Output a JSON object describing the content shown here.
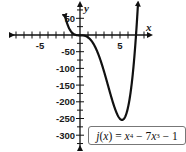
{
  "chart_data": {
    "type": "line",
    "title": "",
    "function_label": "j(x) = x^4 - 7x^3 - 1",
    "function_label_parts": {
      "name": "j",
      "var": "x",
      "equals": "=",
      "term1_base": "x",
      "term1_exp": "4",
      "minus1": "−",
      "term2_coef": "7",
      "term2_base": "x",
      "term2_exp": "3",
      "minus2": "−",
      "constant": "1"
    },
    "xlabel": "x",
    "ylabel": "y",
    "xlim": [
      -9.5,
      9.5
    ],
    "ylim": [
      -340,
      90
    ],
    "x_tick_step": 1,
    "y_tick_step": 25,
    "x_tick_labels": [
      "-5",
      "5"
    ],
    "x_tick_label_values": [
      -5,
      5
    ],
    "y_tick_labels": [
      "50",
      "-50",
      "-100",
      "-150",
      "-200",
      "-250",
      "-300"
    ],
    "y_tick_label_values": [
      50,
      -50,
      -100,
      -150,
      -200,
      -250,
      -300
    ],
    "grid": false,
    "legend": "none",
    "series": [
      {
        "name": "j(x) = x^4 - 7x^3 - 1",
        "x": [
          -2.0,
          -1.5,
          -1.0,
          -0.5,
          0,
          1,
          2,
          3,
          4,
          5,
          5.25,
          6,
          6.5,
          7,
          7.3
        ],
        "values": [
          71,
          28.3,
          7,
          -0.06,
          -1,
          -7,
          -41,
          -109,
          -193,
          -251,
          -258,
          -217,
          -139,
          -1,
          92
        ]
      }
    ],
    "annotations": [
      "minimum near x ≈ 5.25, y ≈ -258",
      "arrows on both curve ends and axis ends"
    ]
  }
}
